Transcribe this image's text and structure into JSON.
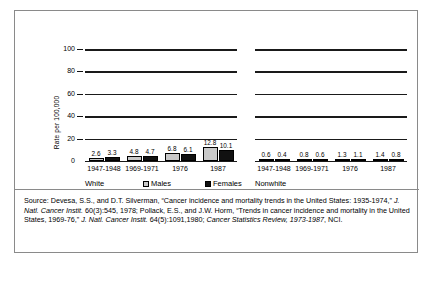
{
  "axis": {
    "ylabel": "Rate per 100,000",
    "yticks": [
      "0",
      "20",
      "40",
      "60",
      "80",
      "100"
    ]
  },
  "legend": {
    "males": "Males",
    "females": "Females"
  },
  "groups": {
    "white": "White",
    "nonwhite": "Nonwhite"
  },
  "categories": [
    "1947-1948",
    "1969-1971",
    "1976",
    "1987"
  ],
  "source": {
    "prefix": "Source:",
    "text_1": " Devesa, S.S., and D.T. Silverman, “Cancer incidence and mortality trends in the United States: 1935-1974,” ",
    "ital_1": "J. Natl. Cancer Instit.",
    "text_2": " 60(3):545, 1978; Pollack, E.S., and J.W. Horm, “Trends in cancer incidence and mortality in the United States, 1969-76,” ",
    "ital_2": "J. Natl. Cancer Instit.",
    "text_3": " 64(5):1091,1980; ",
    "ital_3": "Cancer Statistics Review, 1973-1987",
    "text_4": ", NCI."
  },
  "chart_data": {
    "type": "bar",
    "title": "",
    "xlabel": "",
    "ylabel": "Rate per 100,000",
    "ylim": [
      0,
      100
    ],
    "yticks": [
      0,
      20,
      40,
      60,
      80,
      100
    ],
    "grid": true,
    "legend_position": "bottom",
    "panels": [
      {
        "name": "White",
        "categories": [
          "1947-1948",
          "1969-1971",
          "1976",
          "1987"
        ],
        "series": [
          {
            "name": "Males",
            "values": [
              2.6,
              4.8,
              6.8,
              12.8
            ]
          },
          {
            "name": "Females",
            "values": [
              3.3,
              4.7,
              6.1,
              10.1
            ]
          }
        ]
      },
      {
        "name": "Nonwhite",
        "categories": [
          "1947-1948",
          "1969-1971",
          "1976",
          "1987"
        ],
        "series": [
          {
            "name": "Males",
            "values": [
              0.6,
              0.8,
              1.3,
              1.4
            ]
          },
          {
            "name": "Females",
            "values": [
              0.4,
              0.6,
              1.1,
              0.8
            ]
          }
        ]
      }
    ]
  }
}
